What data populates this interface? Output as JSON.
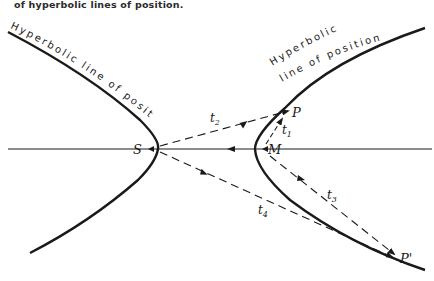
{
  "caption": "of hyperbolic lines of position.",
  "curve_labels": {
    "left": "Hyperbolic line of position",
    "right_line1": "Hyperbolic",
    "right_line2": "line of position"
  },
  "points": {
    "S": "S",
    "M": "M",
    "P": "P",
    "P_prime": "P'"
  },
  "time_labels": {
    "t1": "t",
    "t1_sub": "1",
    "t2": "t",
    "t2_sub": "2",
    "t3": "t",
    "t3_sub": "3",
    "t4": "t",
    "t4_sub": "4"
  },
  "colors": {
    "ink": "#1a1a1a",
    "background": "#ffffff"
  }
}
